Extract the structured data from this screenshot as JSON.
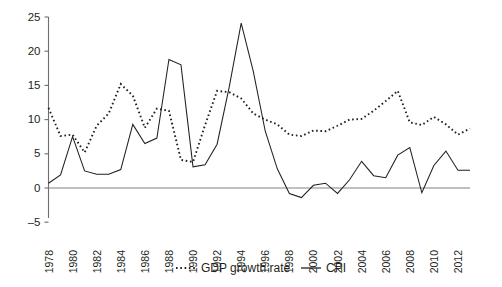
{
  "chart_data": {
    "type": "line",
    "title": "",
    "subtitle": "",
    "xlabel": "",
    "ylabel": "",
    "xlim": [
      1978,
      2013
    ],
    "ylim": [
      -5,
      25
    ],
    "yticks": [
      -5,
      0,
      5,
      10,
      15,
      20,
      25
    ],
    "ytick_labels": [
      "–5",
      "0",
      "5",
      "10",
      "15",
      "20",
      "25"
    ],
    "xticks": [
      1978,
      1980,
      1982,
      1984,
      1986,
      1988,
      1990,
      1992,
      1994,
      1996,
      1998,
      2000,
      2002,
      2004,
      2006,
      2008,
      2010,
      2012
    ],
    "xtick_labels": [
      "1978",
      "1980",
      "1982",
      "1984",
      "1986",
      "1988",
      "1990",
      "1992",
      "1994",
      "1996",
      "1998",
      "2000",
      "2002",
      "2004",
      "2006",
      "2008",
      "2010",
      "2012"
    ],
    "x": [
      1978,
      1979,
      1980,
      1981,
      1982,
      1983,
      1984,
      1985,
      1986,
      1987,
      1988,
      1989,
      1990,
      1991,
      1992,
      1993,
      1994,
      1995,
      1996,
      1997,
      1998,
      1999,
      2000,
      2001,
      2002,
      2003,
      2004,
      2005,
      2006,
      2007,
      2008,
      2009,
      2010,
      2011,
      2012,
      2013
    ],
    "grid": false,
    "legend_position": "bottom-center",
    "series": [
      {
        "name": "GDP growth rate",
        "style": "dotted",
        "color": "#231f20",
        "values": [
          11.7,
          7.6,
          7.8,
          5.2,
          9.1,
          10.9,
          15.2,
          13.5,
          8.8,
          11.6,
          11.3,
          4.1,
          3.8,
          9.2,
          14.2,
          14.0,
          13.1,
          10.9,
          10.0,
          9.3,
          7.8,
          7.6,
          8.4,
          8.3,
          9.1,
          10.0,
          10.1,
          11.3,
          12.7,
          14.2,
          9.6,
          9.2,
          10.4,
          9.3,
          7.8,
          8.7
        ]
      },
      {
        "name": "CPI",
        "style": "solid",
        "color": "#231f20",
        "values": [
          0.7,
          1.9,
          7.5,
          2.5,
          2.0,
          2.0,
          2.7,
          9.3,
          6.5,
          7.3,
          18.8,
          18.0,
          3.1,
          3.4,
          6.4,
          14.7,
          24.1,
          17.1,
          8.3,
          2.8,
          -0.8,
          -1.4,
          0.4,
          0.7,
          -0.8,
          1.2,
          3.9,
          1.8,
          1.5,
          4.8,
          5.9,
          -0.7,
          3.3,
          5.4,
          2.6,
          2.6
        ]
      }
    ]
  },
  "legend": {
    "items": [
      {
        "label": "GDP growth rate",
        "style": "dotted"
      },
      {
        "label": "CPI",
        "style": "solid"
      }
    ]
  }
}
